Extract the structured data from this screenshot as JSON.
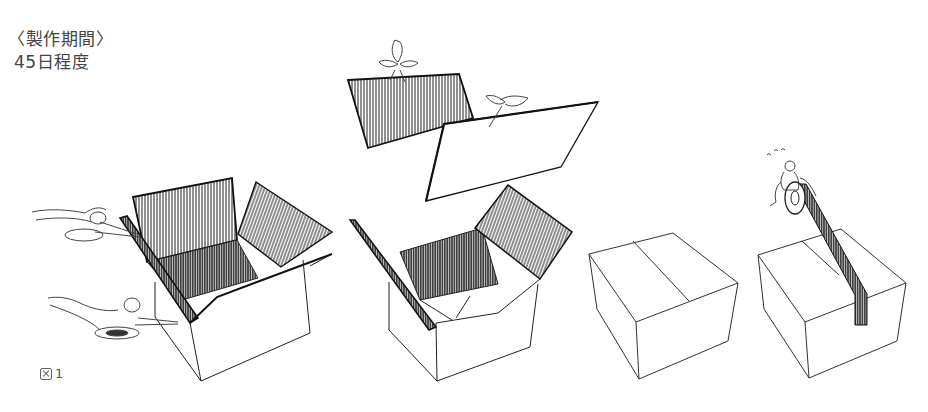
{
  "document": {
    "cut_heading": "（annotated）",
    "production_period": {
      "label": "〈製作期間〉",
      "value": "45日程度"
    },
    "figure": {
      "icon": "figure-icon",
      "number": "1"
    },
    "illustrations": [
      {
        "step": 1,
        "description": "Open cardboard box with flaps being cut by two pairs of scissors"
      },
      {
        "step": 2,
        "description": "Open box with two flaps lifted away by small winged figures"
      },
      {
        "step": 3,
        "description": "Closed plain cardboard box"
      },
      {
        "step": 4,
        "description": "Small figure riding a tape roll, taping the closed box seam"
      }
    ],
    "colors": {
      "ink": "#222222",
      "background": "#ffffff"
    }
  }
}
